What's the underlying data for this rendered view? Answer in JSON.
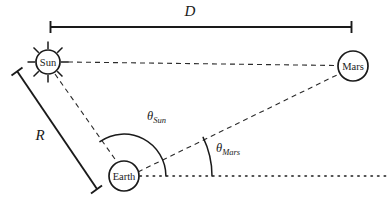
{
  "figure": {
    "background_color": "#ffffff",
    "line_color": "#1a1a1a",
    "width": 388,
    "height": 204
  },
  "bodies": {
    "sun": {
      "label": "Sun",
      "cx": 48,
      "cy": 62,
      "r": 12,
      "ray_count": 8,
      "icon": "sun-icon"
    },
    "earth": {
      "label": "Earth",
      "cx": 124,
      "cy": 176,
      "r": 15,
      "icon": "earth-icon"
    },
    "mars": {
      "label": "Mars",
      "cx": 353,
      "cy": 66,
      "r": 15,
      "icon": "mars-icon"
    }
  },
  "dimensions": {
    "d": {
      "label": "D",
      "description": "Sun to Mars distance",
      "x1": 50,
      "x2": 352,
      "y": 27,
      "label_x": 190,
      "label_y": 16
    },
    "r": {
      "label": "R",
      "description": "Sun to Earth distance",
      "x1": 17,
      "y1": 71,
      "x2": 97,
      "y2": 189,
      "label_x": 40,
      "label_y": 140
    }
  },
  "angles": {
    "theta_sun": {
      "symbol": "θ",
      "subscript": "Sun",
      "vertex": "earth",
      "radius": 42,
      "label_x": 147,
      "label_y": 120
    },
    "theta_mars": {
      "symbol": "θ",
      "subscript": "Mars",
      "vertex": "earth",
      "radius": 88,
      "label_x": 216,
      "label_y": 152
    }
  },
  "lines": {
    "sun_mars": {
      "style": "dashed",
      "from": "sun",
      "to": "mars"
    },
    "sun_earth": {
      "style": "dashed",
      "from": "sun",
      "to": "earth"
    },
    "earth_mars": {
      "style": "dashed",
      "from": "earth",
      "to": "mars"
    },
    "earth_baseline": {
      "style": "dotted",
      "description": "horizontal reference line from Earth",
      "x1": 139,
      "x2": 386,
      "y": 176
    }
  }
}
